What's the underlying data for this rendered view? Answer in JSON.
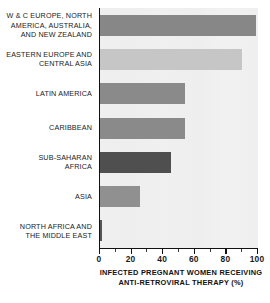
{
  "chart_data": {
    "type": "bar",
    "orientation": "horizontal",
    "title": "",
    "xlabel": "INFECTED PREGNANT WOMEN RECEIVING ANTI-RETROVIRAL THERAPY (%)",
    "ylabel": "",
    "xlim": [
      0,
      100
    ],
    "grid": false,
    "legend": "none",
    "categories": [
      "W & C EUROPE, NORTH AMERICA, AUSTRALIA, AND NEW ZEALAND",
      "EASTERN EUROPE AND CENTRAL ASIA",
      "LATIN AMERICA",
      "CARIBBEAN",
      "SUB-SAHARAN AFRICA",
      "ASIA",
      "NORTH AFRICA AND THE MIDDLE EAST"
    ],
    "values": [
      99,
      90,
      54,
      54,
      45,
      25,
      1
    ],
    "bar_colors": [
      "#878787",
      "#c6c6c6",
      "#8a8a8a",
      "#8a8a8a",
      "#4f4f4f",
      "#909090",
      "#555555"
    ],
    "xticks": [
      0,
      20,
      40,
      60,
      80,
      100
    ],
    "xtick_labels": [
      "0",
      "20",
      "40",
      "60",
      "80",
      "100"
    ],
    "minor_tick_step": 10,
    "plot_background": "#eeeeee",
    "axis_color": "#111111"
  },
  "axis_title": {
    "line1": "INFECTED PREGNANT WOMEN RECEIVING",
    "line2": "ANTI-RETROVIRAL THERAPY (%)"
  },
  "category_labels": [
    {
      "lines": [
        "W & C EUROPE, NORTH",
        "AMERICA, AUSTRALIA,",
        "AND NEW ZEALAND"
      ]
    },
    {
      "lines": [
        "EASTERN EUROPE AND",
        "CENTRAL ASIA"
      ]
    },
    {
      "lines": [
        "LATIN AMERICA"
      ]
    },
    {
      "lines": [
        "CARIBBEAN"
      ]
    },
    {
      "lines": [
        "SUB-SAHARAN",
        "AFRICA"
      ]
    },
    {
      "lines": [
        "ASIA"
      ]
    },
    {
      "lines": [
        "NORTH AFRICA AND",
        "THE MIDDLE EAST"
      ]
    }
  ]
}
